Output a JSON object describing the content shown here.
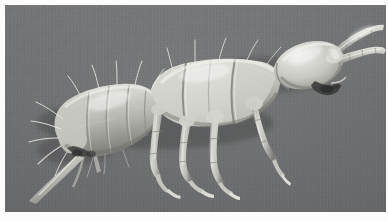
{
  "image": {
    "kind": "scanning-electron-micrograph",
    "subject_common_name": "springtail",
    "subject_group": "Collembola",
    "orientation": "lateral view, head to upper right, abdomen to lower left",
    "caption": "",
    "title": "",
    "colors": {
      "background_gray": "#6e6f70",
      "background_gray_light": "#757677",
      "background_gray_dark": "#67686a",
      "specimen_light": "#e2e2de",
      "specimen_midtone": "#b9b9b4",
      "specimen_shadow": "#8a8a86",
      "specimen_dark": "#4a4a47",
      "mount_border": "#fcfcfc",
      "seta_highlight": "#ededea"
    },
    "anatomy": [
      {
        "id": "antenna-upper",
        "label": "antenna (upper)",
        "segments": 4
      },
      {
        "id": "antenna-lower",
        "label": "antenna (lower)",
        "segments": 4
      },
      {
        "id": "head",
        "label": "head capsule"
      },
      {
        "id": "mouthparts",
        "label": "mouthparts"
      },
      {
        "id": "thorax-1",
        "label": "prothorax"
      },
      {
        "id": "thorax-2",
        "label": "mesothorax"
      },
      {
        "id": "thorax-3",
        "label": "metathorax"
      },
      {
        "id": "abdomen",
        "label": "abdominal segments",
        "segments": 5
      },
      {
        "id": "leg-fore",
        "label": "foreleg"
      },
      {
        "id": "leg-mid",
        "label": "midleg"
      },
      {
        "id": "leg-hind",
        "label": "hindleg"
      },
      {
        "id": "furca",
        "label": "furca (spring organ)"
      },
      {
        "id": "setae",
        "label": "setae (bristles)"
      }
    ],
    "border": {
      "top_px": 5,
      "left_px": 5,
      "right_px": 2,
      "bottom_px": 10
    }
  }
}
